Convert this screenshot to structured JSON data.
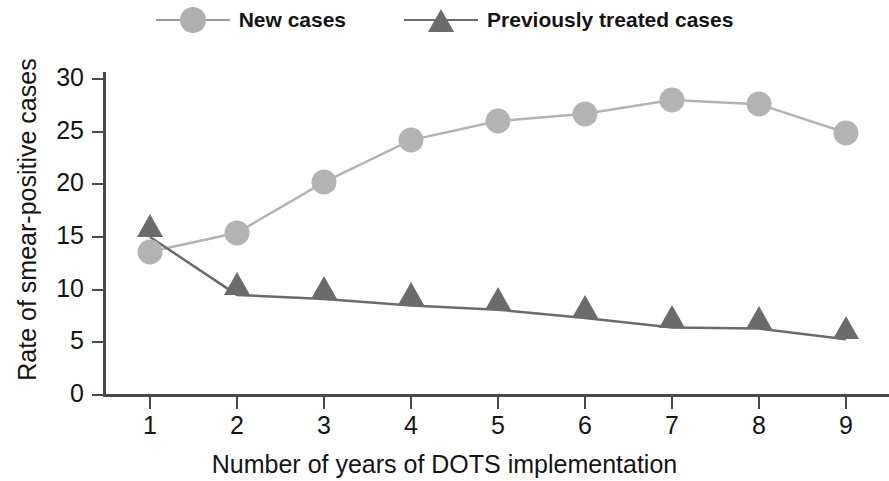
{
  "legend": {
    "items": [
      {
        "label": "New cases",
        "marker": "circle-marker",
        "color": "#b3b3b3"
      },
      {
        "label": "Previously treated cases",
        "marker": "triangle-marker",
        "color": "#6b6b6b"
      }
    ]
  },
  "chart_data": {
    "type": "line",
    "title": "",
    "xlabel": "Number of years of DOTS implementation",
    "ylabel": "Rate of smear-positive cases",
    "x": [
      1,
      2,
      3,
      4,
      5,
      6,
      7,
      8,
      9
    ],
    "xticklabels": [
      "1",
      "2",
      "3",
      "4",
      "5",
      "6",
      "7",
      "8",
      "9"
    ],
    "yticklabels": [
      "0",
      "5",
      "10",
      "15",
      "20",
      "25",
      "30"
    ],
    "yticks": [
      0,
      5,
      10,
      15,
      20,
      25,
      30
    ],
    "xlim": [
      0.5,
      9.5
    ],
    "ylim": [
      0,
      30
    ],
    "grid": false,
    "legend_position": "top-center",
    "series": [
      {
        "name": "New cases",
        "marker": "circle",
        "color": "#b3b3b3",
        "values": [
          13.6,
          15.4,
          20.2,
          24.2,
          26.0,
          26.7,
          28.0,
          27.6,
          24.9
        ]
      },
      {
        "name": "Previously treated cases",
        "marker": "triangle",
        "color": "#6b6b6b",
        "values": [
          15.0,
          9.5,
          9.1,
          8.5,
          8.1,
          7.3,
          6.4,
          6.3,
          5.3
        ]
      }
    ]
  }
}
